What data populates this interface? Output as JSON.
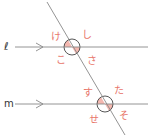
{
  "diagram": {
    "lines": {
      "l_label": "ℓ",
      "m_label": "m"
    },
    "angles_top": {
      "ke": "け",
      "shi": "し",
      "ko": "こ",
      "sa": "さ"
    },
    "angles_bottom": {
      "su": "す",
      "ta": "た",
      "se": "せ",
      "so": "そ"
    },
    "colors": {
      "line": "#888888",
      "label": "#e8756a",
      "shade": "#f4b8b0",
      "circle": "#444444"
    }
  }
}
